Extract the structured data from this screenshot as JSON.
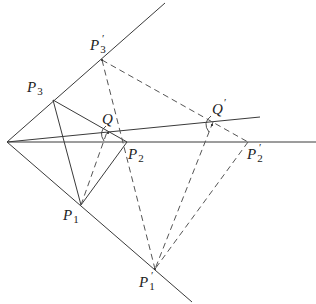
{
  "diagram": {
    "type": "geometric construction",
    "colors": {
      "line": "#3a3a3a",
      "dashed": "#555555",
      "background": "#ffffff"
    },
    "points": {
      "O": {
        "x": 7,
        "y": 142
      },
      "P1": {
        "x": 81,
        "y": 205
      },
      "P2": {
        "x": 127,
        "y": 142
      },
      "P3": {
        "x": 53,
        "y": 100
      },
      "Q": {
        "x": 107,
        "y": 132
      },
      "P1p": {
        "x": 155,
        "y": 269
      },
      "P2p": {
        "x": 248,
        "y": 142
      },
      "P3p": {
        "x": 102,
        "y": 60
      },
      "Qp": {
        "x": 213,
        "y": 122
      }
    },
    "labels": {
      "P1": {
        "base": "P",
        "sub": "1",
        "prime": ""
      },
      "P2": {
        "base": "P",
        "sub": "2",
        "prime": ""
      },
      "P3": {
        "base": "P",
        "sub": "3",
        "prime": ""
      },
      "Q": {
        "base": "Q",
        "sub": "",
        "prime": ""
      },
      "P1p": {
        "base": "P",
        "sub": "1",
        "prime": "′"
      },
      "P2p": {
        "base": "P",
        "sub": "2",
        "prime": "′"
      },
      "P3p": {
        "base": "P",
        "sub": "3",
        "prime": "′"
      },
      "Qp": {
        "base": "Q",
        "sub": "",
        "prime": "′"
      }
    },
    "solid_segments": [
      [
        "O",
        "upper-ray-end"
      ],
      [
        "O",
        "lower-ray-end"
      ],
      [
        "O",
        "horizontal-end"
      ],
      [
        "O",
        "slanted-end"
      ],
      [
        "P3",
        "P2"
      ],
      [
        "P3",
        "P1"
      ],
      [
        "P1",
        "P2"
      ]
    ],
    "dashed_segments": [
      [
        "P1",
        "Q"
      ],
      [
        "P3p",
        "P2p"
      ],
      [
        "P3p",
        "P1p"
      ],
      [
        "Qp",
        "P1p"
      ],
      [
        "P2p",
        "P1p"
      ]
    ]
  }
}
